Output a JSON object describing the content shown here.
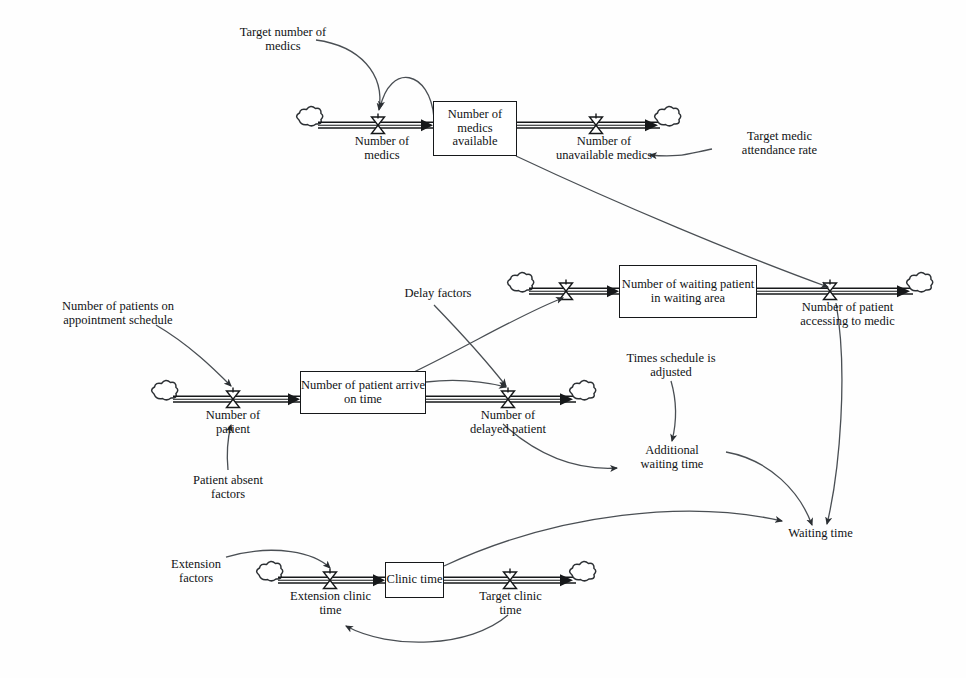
{
  "diagram": {
    "type": "system-dynamics-stock-and-flow",
    "colors": {
      "line": "#2b2f33",
      "text": "#111315",
      "box_border": "#16181a",
      "background": "#ffffff"
    },
    "stocks": [
      {
        "id": "medics-available",
        "label": "Number of\nmedics\navailable",
        "x": 433,
        "y": 101,
        "w": 84,
        "h": 55,
        "font_size": 12.5
      },
      {
        "id": "patient-arrive-on-time",
        "label": "Number of patient\narrive on time",
        "x": 300,
        "y": 371,
        "w": 126,
        "h": 43,
        "font_size": 12.5
      },
      {
        "id": "waiting-patient-in-waiting-area",
        "label": "Number of waiting\npatient in waiting area",
        "x": 619,
        "y": 265,
        "w": 138,
        "h": 53,
        "font_size": 12.5
      },
      {
        "id": "clinic-time",
        "label": "Clinic\ntime",
        "x": 385,
        "y": 562,
        "w": 59,
        "h": 36,
        "font_size": 12.5
      }
    ],
    "flows": [
      {
        "id": "number-of-medics",
        "label": "Number of\nmedics",
        "label_x": 337,
        "label_y": 135,
        "label_w": 90,
        "valve_x": 378,
        "valve_y": 125,
        "font_size": 12.5
      },
      {
        "id": "number-of-unavailable-medics",
        "label": "Number of\nunavailable medics",
        "label_x": 529,
        "label_y": 135,
        "label_w": 150,
        "valve_x": 596,
        "valve_y": 125,
        "font_size": 12.5
      },
      {
        "id": "number-of-patient",
        "label": "Number of\npatient",
        "label_x": 160,
        "label_y": 409,
        "label_w": 100,
        "valve_x": 233,
        "valve_y": 399,
        "font_size": 12.5
      },
      {
        "id": "number-of-delayed-patient",
        "label": "Number of\ndelayed patient",
        "label_x": 443,
        "label_y": 409,
        "label_w": 125,
        "valve_x": 508,
        "valve_y": 399,
        "font_size": 12.5
      },
      {
        "id": "number-of-patient-accessing-to-medic",
        "label": "Number of patient\naccessing to medic",
        "label_x": 772,
        "label_y": 303,
        "label_w": 150,
        "valve_x": 830,
        "valve_y": 291,
        "font_size": 12.5
      },
      {
        "id": "extension-clinic-time",
        "label": "Extension clinic\ntime",
        "label_x": 271,
        "label_y": 590,
        "label_w": 125,
        "valve_x": 330,
        "valve_y": 580,
        "font_size": 12.5
      },
      {
        "id": "target-clinic-time",
        "label": "Target clinic\ntime",
        "label_x": 460,
        "label_y": 590,
        "label_w": 105,
        "valve_x": 510,
        "valve_y": 580,
        "font_size": 12.5
      }
    ],
    "auxiliaries": [
      {
        "id": "target-number-of-medics",
        "label": "Target number of\nmedics",
        "x": 213,
        "y": 26,
        "w": 140,
        "font_size": 12.5
      },
      {
        "id": "target-medic-attendance-rate",
        "label": "Target medic\nattendance rate",
        "x": 712,
        "y": 130,
        "w": 135,
        "font_size": 12.5
      },
      {
        "id": "number-of-patients-on-appointment-schedule",
        "label": "Number of patients on\nappointment schedule",
        "x": 27,
        "y": 300,
        "w": 180,
        "font_size": 12.5
      },
      {
        "id": "delay-factors",
        "label": "Delay factors",
        "x": 383,
        "y": 287,
        "w": 110,
        "font_size": 12.5
      },
      {
        "id": "patient-absent-factors",
        "label": "Patient absent\nfactors",
        "x": 146,
        "y": 474,
        "w": 120,
        "font_size": 12.5
      },
      {
        "id": "times-schedule-is-adjusted",
        "label": "Times schedule is\nadjusted",
        "x": 605,
        "y": 352,
        "w": 140,
        "font_size": 12.5
      },
      {
        "id": "additional-waiting-time",
        "label": "Additional\nwaiting time",
        "x": 622,
        "y": 446,
        "w": 110,
        "font_size": 12.5
      },
      {
        "id": "waiting-time",
        "label": "Waiting time",
        "x": 770,
        "y": 529,
        "w": 105,
        "font_size": 12.5
      },
      {
        "id": "extension-factors",
        "label": "Extension\nfactors",
        "x": 146,
        "y": 560,
        "w": 100,
        "font_size": 12.5
      }
    ],
    "clouds": [
      {
        "id": "cloud-medics-source",
        "x": 305,
        "y": 125
      },
      {
        "id": "cloud-medics-sink",
        "x": 663,
        "y": 125
      },
      {
        "id": "cloud-patient-source",
        "x": 160,
        "y": 399
      },
      {
        "id": "cloud-delayed-patient-sink",
        "x": 578,
        "y": 399
      },
      {
        "id": "cloud-waiting-area-source",
        "x": 516,
        "y": 291
      },
      {
        "id": "cloud-accessing-medic-sink",
        "x": 915,
        "y": 291
      },
      {
        "id": "cloud-clinic-source",
        "x": 265,
        "y": 580
      },
      {
        "id": "cloud-clinic-sink",
        "x": 578,
        "y": 580
      }
    ],
    "connectors": [
      {
        "id": "connector-target-medics-to-number-of-medics",
        "from": "target-number-of-medics",
        "to": "number-of-medics"
      },
      {
        "id": "connector-medics-available-to-number-of-medics",
        "from": "medics-available",
        "to": "number-of-medics"
      },
      {
        "id": "connector-target-attendance-to-unavailable-medics",
        "from": "target-medic-attendance-rate",
        "to": "number-of-unavailable-medics"
      },
      {
        "id": "connector-medics-available-to-accessing-medic",
        "from": "medics-available",
        "to": "number-of-patient-accessing-to-medic"
      },
      {
        "id": "connector-appointment-schedule-to-number-of-patient",
        "from": "number-of-patients-on-appointment-schedule",
        "to": "number-of-patient"
      },
      {
        "id": "connector-absent-factors-to-number-of-patient",
        "from": "patient-absent-factors",
        "to": "number-of-patient"
      },
      {
        "id": "connector-arrive-on-time-to-delayed-patient",
        "from": "patient-arrive-on-time",
        "to": "number-of-delayed-patient"
      },
      {
        "id": "connector-delay-factors-to-delayed-patient",
        "from": "delay-factors",
        "to": "number-of-delayed-patient"
      },
      {
        "id": "connector-arrive-on-time-to-waiting-area-inflow",
        "from": "patient-arrive-on-time",
        "to": "waiting-area-inflow-valve"
      },
      {
        "id": "connector-delayed-patient-to-additional-waiting-time",
        "from": "number-of-delayed-patient",
        "to": "additional-waiting-time"
      },
      {
        "id": "connector-times-schedule-to-additional-waiting-time",
        "from": "times-schedule-is-adjusted",
        "to": "additional-waiting-time"
      },
      {
        "id": "connector-additional-waiting-time-to-waiting-time",
        "from": "additional-waiting-time",
        "to": "waiting-time"
      },
      {
        "id": "connector-accessing-medic-to-waiting-time",
        "from": "number-of-patient-accessing-to-medic",
        "to": "waiting-time"
      },
      {
        "id": "connector-clinic-time-to-waiting-time",
        "from": "clinic-time",
        "to": "waiting-time"
      },
      {
        "id": "connector-extension-factors-to-extension-clinic-time",
        "from": "extension-factors",
        "to": "extension-clinic-time"
      },
      {
        "id": "connector-target-clinic-time-to-extension-clinic-time",
        "from": "target-clinic-time",
        "to": "extension-clinic-time"
      }
    ]
  }
}
